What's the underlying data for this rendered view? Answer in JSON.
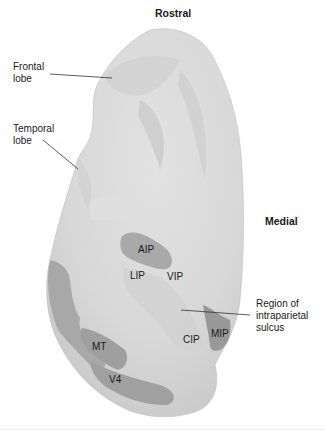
{
  "orientation": {
    "top": "Rostral",
    "right": "Medial"
  },
  "callouts": {
    "frontal": "Frontal\nlobe",
    "temporal": "Temporal\nlobe",
    "ips": "Region of\nintraparietal\nsulcus"
  },
  "areas": {
    "aip": "AIP",
    "lip": "LIP",
    "vip": "VIP",
    "cip": "CIP",
    "mip": "MIP",
    "mt": "MT",
    "v4": "V4"
  },
  "colors": {
    "cortex_light": "#e6e6e6",
    "cortex_mid": "#cfcfcf",
    "area_dark": "#9a9a9a",
    "area_light": "#c4c4c4",
    "leader": "#333333"
  }
}
